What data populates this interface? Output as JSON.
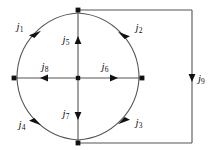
{
  "diagram": {
    "type": "circuit-current-diagram",
    "colors": {
      "wire": "#555555",
      "arrow": "#111111",
      "node": "#111111",
      "background": "#ffffff",
      "label": "#111111"
    },
    "geometry": {
      "circle_center_x": 78,
      "circle_center_y": 78,
      "circle_radius": 65,
      "rect_right_x": 192,
      "rect_top_y": 10,
      "rect_bottom_y": 143
    },
    "nodes": [
      {
        "name": "node-top",
        "x": 78,
        "y": 10
      },
      {
        "name": "node-bottom",
        "x": 78,
        "y": 143
      },
      {
        "name": "node-left",
        "x": 14,
        "y": 78
      },
      {
        "name": "node-right",
        "x": 142,
        "y": 78
      },
      {
        "name": "node-center",
        "x": 78,
        "y": 78
      },
      {
        "name": "node-corner-top-right",
        "x": 192,
        "y": 10
      },
      {
        "name": "node-corner-bottom-right",
        "x": 192,
        "y": 143
      }
    ],
    "currents": [
      {
        "id": "j1",
        "symbol": "j",
        "subscript": "1",
        "segment": "arc-top-left",
        "direction": "counterclockwise-upward",
        "label_x": 20,
        "label_y": 27
      },
      {
        "id": "j2",
        "symbol": "j",
        "subscript": "2",
        "segment": "arc-top-right",
        "direction": "toward-top-node",
        "label_x": 139,
        "label_y": 28
      },
      {
        "id": "j3",
        "symbol": "j",
        "subscript": "3",
        "segment": "arc-bottom-right",
        "direction": "toward-bottom-node",
        "label_x": 139,
        "label_y": 123
      },
      {
        "id": "j4",
        "symbol": "j",
        "subscript": "4",
        "segment": "arc-bottom-left",
        "direction": "toward-bottom-node",
        "label_x": 22,
        "label_y": 125
      },
      {
        "id": "j5",
        "symbol": "j",
        "subscript": "5",
        "segment": "vertical-diameter-upper",
        "direction": "up",
        "label_x": 66,
        "label_y": 40
      },
      {
        "id": "j6",
        "symbol": "j",
        "subscript": "6",
        "segment": "horizontal-diameter-right",
        "direction": "right",
        "label_x": 105,
        "label_y": 67
      },
      {
        "id": "j7",
        "symbol": "j",
        "subscript": "7",
        "segment": "vertical-diameter-lower",
        "direction": "down",
        "label_x": 66,
        "label_y": 114
      },
      {
        "id": "j8",
        "symbol": "j",
        "subscript": "8",
        "segment": "horizontal-diameter-left",
        "direction": "left",
        "label_x": 45,
        "label_y": 67
      },
      {
        "id": "j9",
        "symbol": "j",
        "subscript": "9",
        "segment": "outer-right-vertical",
        "direction": "down",
        "label_x": 198,
        "label_y": 79
      }
    ]
  }
}
